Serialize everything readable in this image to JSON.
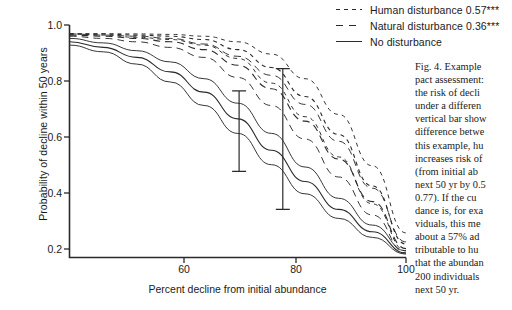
{
  "figure": {
    "caption_id": "Fig. 4.",
    "caption_lines": [
      "Fig. 4. Example",
      "pact assessment:",
      "the risk of decli",
      "under a differen",
      "vertical bar show",
      "difference betwe",
      "this example, hu",
      "increases risk of",
      "(from initial ab",
      "next 50 yr by 0.5",
      "0.77). If the cu",
      "dance is, for exa",
      "viduals, this me",
      "about a 57% ad",
      "tributable to hu",
      "that the abundan",
      "200 individuals",
      "next 50 yr."
    ]
  },
  "chart_data": {
    "type": "line",
    "title": "",
    "xlabel": "Percent decline from initial abundance",
    "ylabel": "Probability of decline within 50 years",
    "xlim": [
      50,
      100
    ],
    "ylim": [
      0.0,
      1.04
    ],
    "xticks": [
      60,
      80,
      100
    ],
    "xtick_labels": [
      "60",
      "80",
      "100"
    ],
    "yticks": [
      0.2,
      0.4,
      0.6,
      0.8,
      1.0
    ],
    "ytick_labels": [
      "0.2",
      "0.4",
      "0.6",
      "0.8",
      "1.0"
    ],
    "grid": false,
    "legend_position": "top-right",
    "line_color": "#2b2b2b",
    "series": [
      {
        "name": "Human disturbance 0.57***",
        "style": "dotted",
        "value": 0.57,
        "significance": "***",
        "x": [
          50,
          55,
          60,
          65,
          70,
          75,
          80,
          85,
          90,
          95,
          100
        ],
        "values": [
          1.0,
          1.0,
          0.995,
          0.99,
          0.975,
          0.93,
          0.85,
          0.72,
          0.55,
          0.32,
          0.06
        ],
        "band_upper": [
          1.0,
          1.0,
          1.0,
          0.998,
          0.99,
          0.965,
          0.91,
          0.8,
          0.64,
          0.41,
          0.11
        ],
        "band_lower": [
          1.0,
          0.995,
          0.985,
          0.975,
          0.95,
          0.89,
          0.78,
          0.63,
          0.45,
          0.24,
          0.03
        ]
      },
      {
        "name": "Natural disturbance 0.36***",
        "style": "dashed",
        "value": 0.36,
        "significance": "***",
        "x": [
          50,
          55,
          60,
          65,
          70,
          75,
          80,
          85,
          90,
          95,
          100
        ],
        "values": [
          0.995,
          0.99,
          0.98,
          0.965,
          0.93,
          0.86,
          0.755,
          0.61,
          0.44,
          0.25,
          0.04
        ],
        "band_upper": [
          1.0,
          0.995,
          0.99,
          0.98,
          0.955,
          0.9,
          0.815,
          0.685,
          0.52,
          0.31,
          0.07
        ],
        "band_lower": [
          0.99,
          0.98,
          0.965,
          0.94,
          0.895,
          0.805,
          0.68,
          0.53,
          0.36,
          0.19,
          0.02
        ]
      },
      {
        "name": "No disturbance",
        "style": "solid",
        "x": [
          50,
          55,
          60,
          65,
          70,
          75,
          80,
          85,
          90,
          95,
          100
        ],
        "values": [
          0.965,
          0.94,
          0.895,
          0.83,
          0.74,
          0.62,
          0.48,
          0.34,
          0.215,
          0.115,
          0.02
        ],
        "band_upper": [
          0.98,
          0.96,
          0.925,
          0.875,
          0.8,
          0.69,
          0.555,
          0.405,
          0.265,
          0.145,
          0.03
        ],
        "band_lower": [
          0.95,
          0.92,
          0.865,
          0.785,
          0.68,
          0.555,
          0.415,
          0.285,
          0.175,
          0.09,
          0.015
        ]
      }
    ],
    "annotations": [
      {
        "name": "range-bar-left",
        "x": 75.2,
        "y_top": 0.745,
        "y_bottom": 0.385,
        "caps": true
      },
      {
        "name": "range-bar-right",
        "x": 81.7,
        "y_top": 0.845,
        "y_bottom": 0.215,
        "caps": true
      }
    ]
  }
}
